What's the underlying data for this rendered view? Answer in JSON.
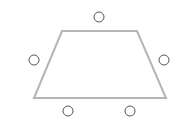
{
  "diagram": {
    "shape": "trapezoid",
    "stroke_color": "#b5b5b5",
    "circle_color": "#555555",
    "trapezoid_points": [
      [
        62,
        31
      ],
      [
        137,
        31
      ],
      [
        166,
        98
      ],
      [
        34,
        98
      ]
    ],
    "circles": [
      {
        "cx": 99,
        "cy": 17,
        "r": 5
      },
      {
        "cx": 34,
        "cy": 60,
        "r": 5
      },
      {
        "cx": 164,
        "cy": 60,
        "r": 5
      },
      {
        "cx": 68,
        "cy": 111,
        "r": 5
      },
      {
        "cx": 130,
        "cy": 111,
        "r": 5
      }
    ]
  }
}
